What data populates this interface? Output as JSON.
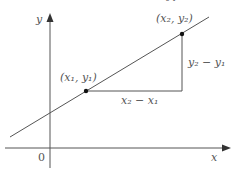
{
  "diagram": {
    "axes": {
      "x_label": "x",
      "y_label": "y",
      "origin_label": "0"
    },
    "point1": {
      "label": "(x₁, y₁)"
    },
    "point2": {
      "label": "(x₂, y₂)"
    },
    "run_label": "x₂ − x₁",
    "rise_label": "y₂ − y₁",
    "top_partial": "₂  ₁"
  }
}
